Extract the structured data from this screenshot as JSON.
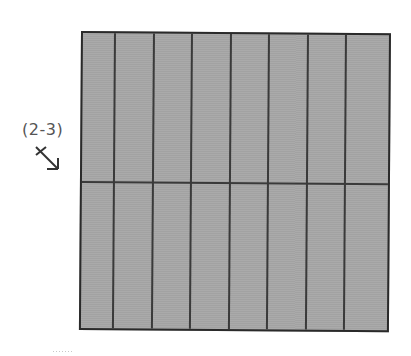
{
  "diagram": {
    "label": "(2-3)",
    "arrow_icon": "diagonal-arrow-down-right-icon",
    "grid": {
      "columns": 8,
      "rows": 2,
      "fill_color": "#a8a8a8",
      "line_color": "#3a3a3a",
      "border_color": "#2a2a2a"
    }
  }
}
